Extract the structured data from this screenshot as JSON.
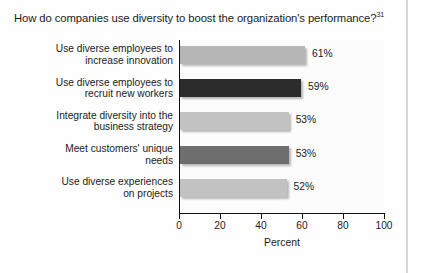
{
  "title": {
    "text": "How do companies use diversity to boost the organization's performance?",
    "note_ref": "31"
  },
  "chart_data": {
    "type": "bar",
    "orientation": "horizontal",
    "title": "How do companies use diversity to boost the organization's performance?",
    "xlabel": "Percent",
    "ylabel": "",
    "xlim": [
      0,
      100
    ],
    "xticks": [
      "0",
      "20",
      "40",
      "60",
      "80",
      "100"
    ],
    "grid": false,
    "legend": "none",
    "categories": [
      "Use diverse employees to increase innovation",
      "Use diverse employees to recruit new workers",
      "Integrate diversity into the business strategy",
      "Meet customers' unique needs",
      "Use diverse experiences on projects"
    ],
    "category_lines": [
      [
        "Use diverse employees to",
        "increase innovation"
      ],
      [
        "Use diverse employees to",
        "recruit new workers"
      ],
      [
        "Integrate diversity into the",
        "business strategy"
      ],
      [
        "Meet customers' unique",
        "needs"
      ],
      [
        "Use diverse experiences",
        "on projects"
      ]
    ],
    "values": [
      61,
      59,
      53,
      53,
      52
    ],
    "data_labels": [
      "61%",
      "59%",
      "53%",
      "53%",
      "52%"
    ],
    "bar_colors": [
      "#b6b6b6",
      "#2c2c2c",
      "#c2c2c2",
      "#6e6e6e",
      "#c2c2c2"
    ]
  },
  "axis": {
    "x_label": "Percent"
  },
  "colors": {
    "axis": "#121212",
    "text": "#1b1b1b",
    "plot_background": "#fcfcfc",
    "page_edge": "#d6d6d6"
  }
}
